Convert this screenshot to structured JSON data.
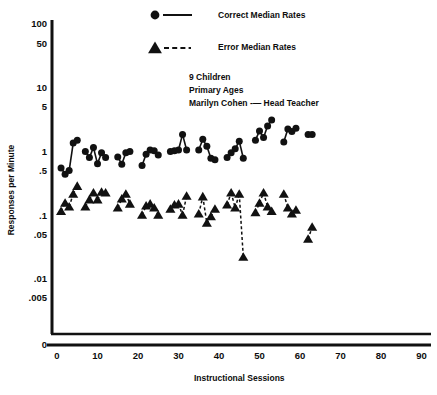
{
  "chart_data": {
    "type": "scatter",
    "title": "",
    "xlabel": "Instructional Sessions",
    "ylabel": "Responses per Minute",
    "yscale": "log",
    "grid": false,
    "legend_position": "top-center",
    "xlim": [
      0,
      90
    ],
    "ylim": [
      0.0035,
      130
    ],
    "xticks": [
      0,
      10,
      20,
      30,
      40,
      50,
      60,
      70,
      80,
      90
    ],
    "xticklabels": [
      "0",
      "10",
      "20",
      "30",
      "40",
      "50",
      "60",
      "70",
      "80",
      "90"
    ],
    "yticks": [
      100,
      50,
      10,
      5,
      1,
      0.5,
      0.1,
      0.05,
      0.01,
      0.005,
      0
    ],
    "yticklabels": [
      "100",
      "50",
      "10",
      "5",
      "1",
      ".5",
      ".1",
      ".05",
      ".01",
      ".005",
      "0"
    ],
    "annotations": [
      "9 Children",
      "Primary Ages",
      "Marilyn Cohen -— Head Teacher"
    ],
    "series": [
      {
        "name": "Correct Median Rates",
        "marker": "circle",
        "linestyle": "solid",
        "color": "#111111",
        "points": [
          {
            "x": 1,
            "y": 0.55
          },
          {
            "x": 2,
            "y": 0.44
          },
          {
            "x": 3,
            "y": 0.5
          },
          {
            "x": 4,
            "y": 1.35
          },
          {
            "x": 5,
            "y": 1.5
          },
          {
            "x": 7,
            "y": 1.0
          },
          {
            "x": 8,
            "y": 0.8
          },
          {
            "x": 9,
            "y": 1.15
          },
          {
            "x": 10,
            "y": 0.64
          },
          {
            "x": 11,
            "y": 0.95
          },
          {
            "x": 12,
            "y": 0.8
          },
          {
            "x": 15,
            "y": 0.82
          },
          {
            "x": 16,
            "y": 0.63
          },
          {
            "x": 17,
            "y": 0.95
          },
          {
            "x": 18,
            "y": 1.0
          },
          {
            "x": 21,
            "y": 0.6
          },
          {
            "x": 22,
            "y": 0.9
          },
          {
            "x": 23,
            "y": 1.05
          },
          {
            "x": 24,
            "y": 1.02
          },
          {
            "x": 25,
            "y": 0.88
          },
          {
            "x": 28,
            "y": 1.0
          },
          {
            "x": 29,
            "y": 1.02
          },
          {
            "x": 30,
            "y": 1.05
          },
          {
            "x": 31,
            "y": 1.85
          },
          {
            "x": 32,
            "y": 1.05
          },
          {
            "x": 35,
            "y": 1.05
          },
          {
            "x": 36,
            "y": 1.55
          },
          {
            "x": 37,
            "y": 1.2
          },
          {
            "x": 38,
            "y": 0.78
          },
          {
            "x": 39,
            "y": 0.74
          },
          {
            "x": 42,
            "y": 0.8
          },
          {
            "x": 43,
            "y": 0.95
          },
          {
            "x": 44,
            "y": 1.1
          },
          {
            "x": 45,
            "y": 1.45
          },
          {
            "x": 46,
            "y": 0.78
          },
          {
            "x": 49,
            "y": 1.5
          },
          {
            "x": 50,
            "y": 2.1
          },
          {
            "x": 51,
            "y": 1.65
          },
          {
            "x": 52,
            "y": 2.5
          },
          {
            "x": 53,
            "y": 3.1
          },
          {
            "x": 56,
            "y": 1.4
          },
          {
            "x": 57,
            "y": 2.25
          },
          {
            "x": 58,
            "y": 2.05
          },
          {
            "x": 59,
            "y": 2.3
          },
          {
            "x": 62,
            "y": 1.85
          },
          {
            "x": 63,
            "y": 1.85
          }
        ],
        "segments": [
          [
            1,
            2
          ],
          [
            2,
            3
          ],
          [
            3,
            4
          ],
          [
            4,
            5
          ],
          [
            7,
            8
          ],
          [
            8,
            9
          ],
          [
            9,
            10
          ],
          [
            10,
            11
          ],
          [
            11,
            12
          ],
          [
            15,
            16
          ],
          [
            16,
            17
          ],
          [
            17,
            18
          ],
          [
            21,
            22
          ],
          [
            22,
            23
          ],
          [
            23,
            24
          ],
          [
            24,
            25
          ],
          [
            28,
            29
          ],
          [
            29,
            30
          ],
          [
            30,
            31
          ],
          [
            31,
            32
          ],
          [
            35,
            36
          ],
          [
            36,
            37
          ],
          [
            37,
            38
          ],
          [
            38,
            39
          ],
          [
            42,
            43
          ],
          [
            43,
            44
          ],
          [
            44,
            45
          ],
          [
            45,
            46
          ],
          [
            49,
            50
          ],
          [
            50,
            51
          ],
          [
            51,
            52
          ],
          [
            52,
            53
          ],
          [
            56,
            57
          ],
          [
            57,
            58
          ],
          [
            58,
            59
          ],
          [
            62,
            63
          ]
        ]
      },
      {
        "name": "Error Median Rates",
        "marker": "triangle",
        "linestyle": "dashed",
        "color": "#111111",
        "points": [
          {
            "x": 1,
            "y": 0.115
          },
          {
            "x": 2,
            "y": 0.155
          },
          {
            "x": 3,
            "y": 0.135
          },
          {
            "x": 4,
            "y": 0.215
          },
          {
            "x": 5,
            "y": 0.285
          },
          {
            "x": 7,
            "y": 0.135
          },
          {
            "x": 8,
            "y": 0.175
          },
          {
            "x": 9,
            "y": 0.225
          },
          {
            "x": 10,
            "y": 0.175
          },
          {
            "x": 11,
            "y": 0.23
          },
          {
            "x": 12,
            "y": 0.225
          },
          {
            "x": 15,
            "y": 0.13
          },
          {
            "x": 16,
            "y": 0.18
          },
          {
            "x": 17,
            "y": 0.215
          },
          {
            "x": 18,
            "y": 0.15
          },
          {
            "x": 21,
            "y": 0.1
          },
          {
            "x": 22,
            "y": 0.14
          },
          {
            "x": 23,
            "y": 0.15
          },
          {
            "x": 24,
            "y": 0.13
          },
          {
            "x": 25,
            "y": 0.1
          },
          {
            "x": 28,
            "y": 0.125
          },
          {
            "x": 29,
            "y": 0.145
          },
          {
            "x": 30,
            "y": 0.15
          },
          {
            "x": 31,
            "y": 0.1
          },
          {
            "x": 32,
            "y": 0.2
          },
          {
            "x": 35,
            "y": 0.105
          },
          {
            "x": 36,
            "y": 0.195
          },
          {
            "x": 37,
            "y": 0.075
          },
          {
            "x": 38,
            "y": 0.095
          },
          {
            "x": 39,
            "y": 0.125
          },
          {
            "x": 42,
            "y": 0.145
          },
          {
            "x": 43,
            "y": 0.225
          },
          {
            "x": 44,
            "y": 0.13
          },
          {
            "x": 45,
            "y": 0.215
          },
          {
            "x": 46,
            "y": 0.022
          },
          {
            "x": 49,
            "y": 0.11
          },
          {
            "x": 50,
            "y": 0.155
          },
          {
            "x": 51,
            "y": 0.225
          },
          {
            "x": 52,
            "y": 0.135
          },
          {
            "x": 53,
            "y": 0.115
          },
          {
            "x": 56,
            "y": 0.215
          },
          {
            "x": 57,
            "y": 0.13
          },
          {
            "x": 58,
            "y": 0.105
          },
          {
            "x": 59,
            "y": 0.12
          },
          {
            "x": 62,
            "y": 0.042
          },
          {
            "x": 63,
            "y": 0.065
          }
        ],
        "segments": [
          [
            1,
            2
          ],
          [
            2,
            3
          ],
          [
            3,
            4
          ],
          [
            4,
            5
          ],
          [
            7,
            8
          ],
          [
            8,
            9
          ],
          [
            9,
            10
          ],
          [
            10,
            11
          ],
          [
            11,
            12
          ],
          [
            15,
            16
          ],
          [
            16,
            17
          ],
          [
            17,
            18
          ],
          [
            21,
            22
          ],
          [
            22,
            23
          ],
          [
            23,
            24
          ],
          [
            24,
            25
          ],
          [
            28,
            29
          ],
          [
            29,
            30
          ],
          [
            30,
            31
          ],
          [
            31,
            32
          ],
          [
            35,
            36
          ],
          [
            36,
            37
          ],
          [
            37,
            38
          ],
          [
            38,
            39
          ],
          [
            42,
            43
          ],
          [
            43,
            44
          ],
          [
            44,
            45
          ],
          [
            45,
            46
          ],
          [
            49,
            50
          ],
          [
            50,
            51
          ],
          [
            51,
            52
          ],
          [
            52,
            53
          ],
          [
            56,
            57
          ],
          [
            57,
            58
          ],
          [
            58,
            59
          ],
          [
            62,
            63
          ]
        ]
      }
    ]
  },
  "legend": {
    "entries": [
      {
        "label": "Correct Median Rates",
        "marker": "circle-marker",
        "line": "solid-line"
      },
      {
        "label": "Error Median Rates",
        "marker": "triangle-marker",
        "line": "dashed-line"
      }
    ]
  },
  "axes": {
    "y_title": "Responses per Minute",
    "x_title": "Instructional Sessions"
  }
}
